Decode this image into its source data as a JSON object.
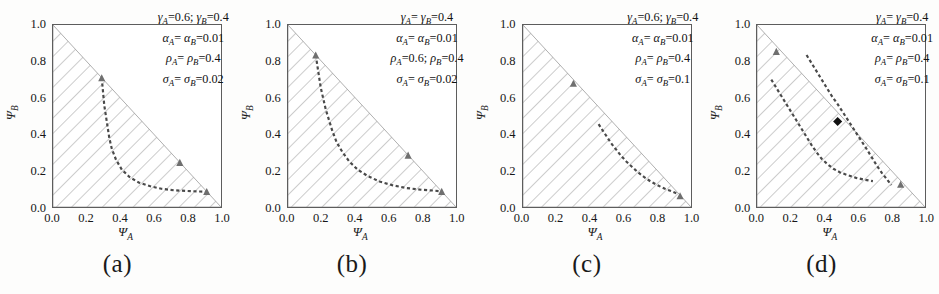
{
  "figure": {
    "background": "#fdfdfc",
    "axis_color": "#5d5d5d",
    "hatch_color": "#9a9a9a",
    "curve_color": "#4a4a4a",
    "marker_color": "#111111",
    "panel_count": 4
  },
  "axes": {
    "xlabel": "Ψ",
    "xlabel_sub": "A",
    "ylabel": "Ψ",
    "ylabel_sub": "B",
    "xticks": [
      "0.0",
      "0.2",
      "0.4",
      "0.6",
      "0.8",
      "1.0"
    ],
    "yticks": [
      "0.0",
      "0.2",
      "0.4",
      "0.6",
      "0.8",
      "1.0"
    ],
    "xlim": [
      0.0,
      1.0
    ],
    "ylim": [
      0.0,
      1.0
    ]
  },
  "chart_data": {
    "type": "line",
    "title": "",
    "xlabel": "Ψ_A",
    "ylabel": "Ψ_B",
    "xlim": [
      0.0,
      1.0
    ],
    "ylim": [
      0.0,
      1.0
    ],
    "grid": false,
    "legend": "none",
    "shared_region": {
      "name": "feasible-simplex",
      "description": "hatched triangle bounded by Ψ_A=0, Ψ_B=0 and Ψ_A+Ψ_B=1",
      "vertices": [
        [
          0.0,
          0.0
        ],
        [
          1.0,
          0.0
        ],
        [
          0.0,
          1.0
        ]
      ],
      "hatch_angle_deg": -45
    },
    "panels": [
      {
        "id": "a",
        "caption": "(a)",
        "params": [
          {
            "text": "γ",
            "sub": "A",
            "eq": "=0.6;  ",
            "text2": "γ",
            "sub2": "B",
            "eq2": "=0.4"
          },
          {
            "text": "α",
            "sub": "A",
            "eq": "=  ",
            "text2": "α",
            "sub2": "B",
            "eq2": "=0.01"
          },
          {
            "text": "ρ",
            "sub": "A",
            "eq": "=  ",
            "text2": "ρ",
            "sub2": "B",
            "eq2": "=0.4"
          },
          {
            "text": "σ",
            "sub": "A",
            "eq": "=  ",
            "text2": "σ",
            "sub2": "B",
            "eq2": "=0.02"
          }
        ],
        "param_values": {
          "gamma_A": 0.6,
          "gamma_B": 0.4,
          "alpha_A": 0.01,
          "alpha_B": 0.01,
          "rho_A": 0.4,
          "rho_B": 0.4,
          "sigma_A": 0.02,
          "sigma_B": 0.02
        },
        "curves": [
          {
            "name": "nullcline",
            "style": "dashed",
            "points": [
              [
                0.29,
                0.71
              ],
              [
                0.295,
                0.66
              ],
              [
                0.3,
                0.61
              ],
              [
                0.305,
                0.56
              ],
              [
                0.315,
                0.5
              ],
              [
                0.325,
                0.44
              ],
              [
                0.335,
                0.38
              ],
              [
                0.35,
                0.32
              ],
              [
                0.375,
                0.26
              ],
              [
                0.41,
                0.205
              ],
              [
                0.455,
                0.165
              ],
              [
                0.51,
                0.135
              ],
              [
                0.575,
                0.115
              ],
              [
                0.645,
                0.1
              ],
              [
                0.72,
                0.092
              ],
              [
                0.8,
                0.088
              ],
              [
                0.875,
                0.085
              ],
              [
                0.92,
                0.083
              ]
            ]
          }
        ],
        "markers": [
          {
            "name": "edge-marker-upper",
            "x": 0.29,
            "y": 0.71,
            "shape": "triangle"
          },
          {
            "name": "edge-marker-right",
            "x": 0.755,
            "y": 0.245,
            "shape": "triangle"
          },
          {
            "name": "edge-marker-lower",
            "x": 0.915,
            "y": 0.085,
            "shape": "triangle"
          }
        ]
      },
      {
        "id": "b",
        "caption": "(b)",
        "params": [
          {
            "text": "γ",
            "sub": "A",
            "eq": "=  ",
            "text2": "γ",
            "sub2": "B",
            "eq2": "=0.4"
          },
          {
            "text": "α",
            "sub": "A",
            "eq": "=  ",
            "text2": "α",
            "sub2": "B",
            "eq2": "=0.01"
          },
          {
            "text": "ρ",
            "sub": "A",
            "eq": "=0.6;  ",
            "text2": "ρ",
            "sub2": "B",
            "eq2": "=0.4"
          },
          {
            "text": "σ",
            "sub": "A",
            "eq": "=  ",
            "text2": "σ",
            "sub2": "B",
            "eq2": "=0.02"
          }
        ],
        "param_values": {
          "gamma_A": 0.4,
          "gamma_B": 0.4,
          "alpha_A": 0.01,
          "alpha_B": 0.01,
          "rho_A": 0.6,
          "rho_B": 0.4,
          "sigma_A": 0.02,
          "sigma_B": 0.02
        },
        "curves": [
          {
            "name": "nullcline",
            "style": "dashed",
            "points": [
              [
                0.165,
                0.835
              ],
              [
                0.175,
                0.775
              ],
              [
                0.185,
                0.715
              ],
              [
                0.195,
                0.655
              ],
              [
                0.21,
                0.595
              ],
              [
                0.225,
                0.535
              ],
              [
                0.245,
                0.475
              ],
              [
                0.265,
                0.415
              ],
              [
                0.29,
                0.355
              ],
              [
                0.325,
                0.3
              ],
              [
                0.365,
                0.25
              ],
              [
                0.415,
                0.205
              ],
              [
                0.475,
                0.17
              ],
              [
                0.545,
                0.14
              ],
              [
                0.62,
                0.12
              ],
              [
                0.7,
                0.105
              ],
              [
                0.79,
                0.095
              ],
              [
                0.87,
                0.09
              ],
              [
                0.915,
                0.086
              ]
            ]
          }
        ],
        "markers": [
          {
            "name": "edge-marker-upper",
            "x": 0.165,
            "y": 0.835,
            "shape": "triangle"
          },
          {
            "name": "edge-marker-right",
            "x": 0.715,
            "y": 0.285,
            "shape": "triangle"
          },
          {
            "name": "edge-marker-lower",
            "x": 0.915,
            "y": 0.086,
            "shape": "triangle"
          }
        ]
      },
      {
        "id": "c",
        "caption": "(c)",
        "params": [
          {
            "text": "γ",
            "sub": "A",
            "eq": "=0.6;  ",
            "text2": "γ",
            "sub2": "B",
            "eq2": "=0.4"
          },
          {
            "text": "α",
            "sub": "A",
            "eq": "=  ",
            "text2": "α",
            "sub2": "B",
            "eq2": "=0.01"
          },
          {
            "text": "ρ",
            "sub": "A",
            "eq": "=  ",
            "text2": "ρ",
            "sub2": "B",
            "eq2": "=0.4"
          },
          {
            "text": "σ",
            "sub": "A",
            "eq": "=  ",
            "text2": "σ",
            "sub2": "B",
            "eq2": "=0.1"
          }
        ],
        "param_values": {
          "gamma_A": 0.6,
          "gamma_B": 0.4,
          "alpha_A": 0.01,
          "alpha_B": 0.01,
          "rho_A": 0.4,
          "rho_B": 0.4,
          "sigma_A": 0.1,
          "sigma_B": 0.1
        },
        "curves": [
          {
            "name": "nullcline",
            "style": "dashed",
            "points": [
              [
                0.45,
                0.455
              ],
              [
                0.475,
                0.42
              ],
              [
                0.5,
                0.385
              ],
              [
                0.525,
                0.35
              ],
              [
                0.555,
                0.315
              ],
              [
                0.585,
                0.28
              ],
              [
                0.615,
                0.25
              ],
              [
                0.65,
                0.22
              ],
              [
                0.685,
                0.19
              ],
              [
                0.72,
                0.165
              ],
              [
                0.76,
                0.14
              ],
              [
                0.8,
                0.12
              ],
              [
                0.845,
                0.1
              ],
              [
                0.89,
                0.085
              ],
              [
                0.925,
                0.07
              ]
            ]
          }
        ],
        "markers": [
          {
            "name": "edge-marker-upper",
            "x": 0.3,
            "y": 0.68,
            "shape": "triangle"
          },
          {
            "name": "edge-marker-lower",
            "x": 0.935,
            "y": 0.062,
            "shape": "triangle"
          }
        ]
      },
      {
        "id": "d",
        "caption": "(d)",
        "params": [
          {
            "text": "γ",
            "sub": "A",
            "eq": "=  ",
            "text2": "γ",
            "sub2": "B",
            "eq2": "=0.4"
          },
          {
            "text": "α",
            "sub": "A",
            "eq": "=  ",
            "text2": "α",
            "sub2": "B",
            "eq2": "=0.01"
          },
          {
            "text": "ρ",
            "sub": "A",
            "eq": "=  ",
            "text2": "ρ",
            "sub2": "B",
            "eq2": "=0.4"
          },
          {
            "text": "σ",
            "sub": "A",
            "eq": "=  ",
            "text2": "σ",
            "sub2": "B",
            "eq2": "=0.1"
          }
        ],
        "param_values": {
          "gamma_A": 0.4,
          "gamma_B": 0.4,
          "alpha_A": 0.01,
          "alpha_B": 0.01,
          "rho_A": 0.4,
          "rho_B": 0.4,
          "sigma_A": 0.1,
          "sigma_B": 0.1
        },
        "curves": [
          {
            "name": "nullcline-A",
            "style": "dashed",
            "points": [
              [
                0.085,
                0.7
              ],
              [
                0.115,
                0.655
              ],
              [
                0.145,
                0.61
              ],
              [
                0.175,
                0.565
              ],
              [
                0.205,
                0.52
              ],
              [
                0.235,
                0.475
              ],
              [
                0.265,
                0.43
              ],
              [
                0.295,
                0.385
              ],
              [
                0.325,
                0.34
              ],
              [
                0.355,
                0.3
              ],
              [
                0.385,
                0.265
              ],
              [
                0.42,
                0.235
              ],
              [
                0.455,
                0.21
              ],
              [
                0.495,
                0.19
              ],
              [
                0.54,
                0.175
              ],
              [
                0.59,
                0.16
              ],
              [
                0.64,
                0.15
              ],
              [
                0.69,
                0.142
              ]
            ]
          },
          {
            "name": "nullcline-B",
            "style": "dashed",
            "points": [
              [
                0.295,
                0.835
              ],
              [
                0.325,
                0.79
              ],
              [
                0.355,
                0.745
              ],
              [
                0.385,
                0.7
              ],
              [
                0.415,
                0.655
              ],
              [
                0.445,
                0.61
              ],
              [
                0.48,
                0.565
              ],
              [
                0.515,
                0.515
              ],
              [
                0.55,
                0.465
              ],
              [
                0.585,
                0.415
              ],
              [
                0.62,
                0.365
              ],
              [
                0.655,
                0.315
              ],
              [
                0.685,
                0.27
              ],
              [
                0.715,
                0.225
              ],
              [
                0.745,
                0.185
              ],
              [
                0.775,
                0.15
              ],
              [
                0.8,
                0.12
              ]
            ]
          }
        ],
        "markers": [
          {
            "name": "fixed-point",
            "x": 0.48,
            "y": 0.47,
            "shape": "diamond-filled"
          },
          {
            "name": "edge-marker-upper",
            "x": 0.115,
            "y": 0.855,
            "shape": "triangle"
          },
          {
            "name": "edge-marker-lower",
            "x": 0.855,
            "y": 0.125,
            "shape": "triangle"
          }
        ]
      }
    ]
  }
}
